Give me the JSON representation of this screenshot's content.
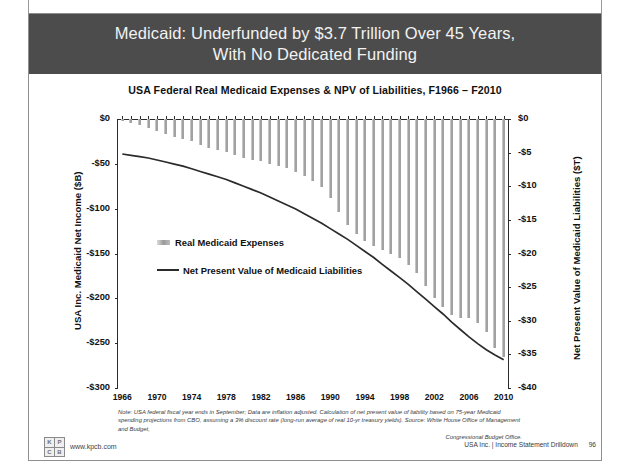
{
  "slide": {
    "headline": "Medicaid: Underfunded by $3.7 Trillion Over 45 Years, With No Dedicated Funding",
    "headline_line1": "Medicaid: Underfunded by $3.7 Trillion Over 45 Years,",
    "headline_line2": "With No Dedicated Funding",
    "band_color": "#4c4c4c",
    "page_number": "96",
    "footer_right": "USA Inc. | Income Statement Drilldown",
    "brand_url": "www.kpcb.com",
    "brand_logo_letters": [
      "K",
      "P",
      "C",
      "B"
    ],
    "note_line1": "Note: USA federal fiscal year ends in September; Data are inflation adjusted. Calculation of net present value of liability based on 75-year Medicaid spending",
    "note_line2": "projections from CBO, assuming a 3% discount rate (long-run average of real 10-yr treasury yields). Source: White House Office of Management and Budget,",
    "note_line3": "Congressional Budget Office."
  },
  "chart_data": {
    "type": "bar",
    "title": "USA Federal Real Medicaid Expenses & NPV of Liabilities, F1966 – F2010",
    "xlabel": "",
    "ylabel": "USA Inc. Medicaid Net Income ($B)",
    "y2label": "Net Present Value of Medicaid Liabilities ($T)",
    "ylim": [
      -300,
      0
    ],
    "y2lim": [
      -40,
      0
    ],
    "yticks": [
      0,
      -50,
      -100,
      -150,
      -200,
      -250,
      -300
    ],
    "ytick_labels": [
      "$0",
      "-$50",
      "-$100",
      "-$150",
      "-$200",
      "-$250",
      "-$300"
    ],
    "y2ticks": [
      0,
      -5,
      -10,
      -15,
      -20,
      -25,
      -30,
      -35,
      -40
    ],
    "y2tick_labels": [
      "$0",
      "-$5",
      "-$10",
      "-$15",
      "-$20",
      "-$25",
      "-$30",
      "-$35",
      "-$40"
    ],
    "xticks": [
      1966,
      1970,
      1974,
      1978,
      1982,
      1986,
      1990,
      1994,
      1998,
      2002,
      2006,
      2010
    ],
    "xtick_labels": [
      "1966",
      "1970",
      "1974",
      "1978",
      "1982",
      "1986",
      "1990",
      "1994",
      "1998",
      "2002",
      "2006",
      "2010"
    ],
    "grid": false,
    "legend_position": "inside-left",
    "legend": [
      {
        "name": "Real Medicaid Expenses",
        "type": "bar",
        "color": "#9a9a9a"
      },
      {
        "name": "Net Present Value of Medicaid Liabilities",
        "type": "line",
        "color": "#2b2b2b"
      }
    ],
    "categories": [
      1966,
      1967,
      1968,
      1969,
      1970,
      1971,
      1972,
      1973,
      1974,
      1975,
      1976,
      1977,
      1978,
      1979,
      1980,
      1981,
      1982,
      1983,
      1984,
      1985,
      1986,
      1987,
      1988,
      1989,
      1990,
      1991,
      1992,
      1993,
      1994,
      1995,
      1996,
      1997,
      1998,
      1999,
      2000,
      2001,
      2002,
      2003,
      2004,
      2005,
      2006,
      2007,
      2008,
      2009,
      2010
    ],
    "series": [
      {
        "name": "Real Medicaid Expenses",
        "axis": "left",
        "units": "$B",
        "values": [
          -2,
          -4,
          -7,
          -10,
          -13,
          -17,
          -20,
          -22,
          -25,
          -29,
          -32,
          -35,
          -37,
          -40,
          -44,
          -46,
          -47,
          -50,
          -52,
          -55,
          -59,
          -64,
          -69,
          -76,
          -88,
          -104,
          -118,
          -128,
          -136,
          -142,
          -146,
          -150,
          -155,
          -163,
          -172,
          -186,
          -200,
          -210,
          -219,
          -222,
          -222,
          -228,
          -238,
          -255,
          -265
        ]
      },
      {
        "name": "Net Present Value of Medicaid Liabilities",
        "axis": "right",
        "units": "$T",
        "values": [
          -5.2,
          -5.4,
          -5.6,
          -5.8,
          -6.1,
          -6.4,
          -6.7,
          -7.0,
          -7.4,
          -7.8,
          -8.2,
          -8.6,
          -9.0,
          -9.5,
          -10.0,
          -10.5,
          -11.0,
          -11.6,
          -12.2,
          -12.8,
          -13.4,
          -14.1,
          -14.8,
          -15.5,
          -16.3,
          -17.1,
          -17.9,
          -18.8,
          -19.7,
          -20.6,
          -21.6,
          -22.6,
          -23.6,
          -24.6,
          -25.7,
          -26.8,
          -27.9,
          -29.0,
          -30.2,
          -31.3,
          -32.4,
          -33.4,
          -34.3,
          -35.1,
          -35.8
        ]
      }
    ]
  }
}
